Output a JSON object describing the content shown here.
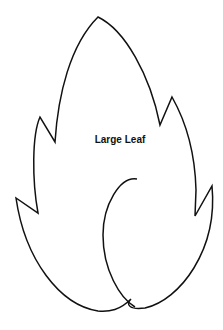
{
  "title": "Large Leaf",
  "colors": {
    "stroke": "#111111",
    "background": "#ffffff"
  }
}
